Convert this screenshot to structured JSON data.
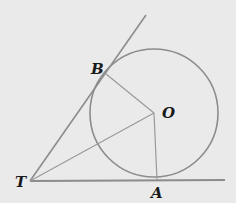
{
  "diagram": {
    "colors": {
      "background": "#eaeaea",
      "stroke": "#8c8c8c",
      "label": "#1a1a1a"
    },
    "points": {
      "T": {
        "label": "T",
        "x": 30,
        "y": 181
      },
      "B": {
        "label": "B",
        "x": 106,
        "y": 73
      },
      "O": {
        "label": "O",
        "x": 154,
        "y": 113
      },
      "A": {
        "label": "A",
        "x": 157,
        "y": 180
      }
    },
    "circle": {
      "center": "O",
      "cx": 154,
      "cy": 113,
      "r": 64
    },
    "segments": [
      {
        "name": "tangent-TA",
        "from": "T",
        "to": "A-extended"
      },
      {
        "name": "tangent-TB",
        "from": "T",
        "to": "B-extended"
      },
      {
        "name": "radius-OB",
        "from": "O",
        "to": "B"
      },
      {
        "name": "radius-OA",
        "from": "O",
        "to": "A"
      },
      {
        "name": "segment-TO",
        "from": "T",
        "to": "O"
      }
    ]
  }
}
